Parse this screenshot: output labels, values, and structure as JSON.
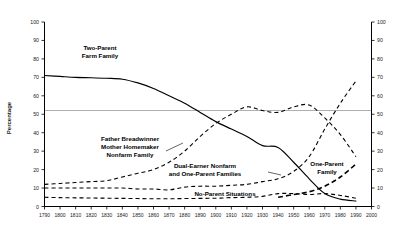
{
  "chart_data": {
    "type": "line",
    "title": "",
    "xlabel": "",
    "ylabel": "Percentage",
    "xlim": [
      1790,
      2000
    ],
    "ylim": [
      0,
      100
    ],
    "grid": false,
    "legend_position": "inline-annotations",
    "reference_lines": [
      {
        "axis": "y",
        "value": 50,
        "color": "#9a9a9a"
      }
    ],
    "x_ticks": [
      1790,
      1800,
      1810,
      1820,
      1830,
      1840,
      1850,
      1860,
      1870,
      1880,
      1890,
      1900,
      1910,
      1920,
      1930,
      1940,
      1950,
      1960,
      1970,
      1980,
      1990,
      2000
    ],
    "y_ticks": [
      0,
      10,
      20,
      30,
      40,
      50,
      60,
      70,
      80,
      90,
      100
    ],
    "y_ticks_right": [
      0,
      10,
      20,
      30,
      40,
      50,
      60,
      70,
      80,
      90,
      100
    ],
    "series": [
      {
        "name": "Two-Parent Farm Family",
        "style": "solid",
        "x": [
          1790,
          1800,
          1810,
          1820,
          1830,
          1840,
          1850,
          1860,
          1870,
          1880,
          1890,
          1900,
          1910,
          1920,
          1930,
          1940,
          1950,
          1960,
          1970,
          1980,
          1990
        ],
        "values": [
          71,
          70.5,
          70,
          69.8,
          69.5,
          69,
          67,
          64,
          60,
          56,
          51,
          46,
          42,
          38,
          33,
          32,
          24,
          15,
          7,
          4,
          3
        ]
      },
      {
        "name": "Father Breadwinner Mother Homemaker Nonfarm Family",
        "style": "dashed",
        "x": [
          1790,
          1800,
          1810,
          1820,
          1830,
          1840,
          1850,
          1860,
          1870,
          1880,
          1890,
          1900,
          1910,
          1920,
          1930,
          1940,
          1950,
          1960,
          1970,
          1980,
          1990
        ],
        "values": [
          12,
          12.5,
          13,
          13.5,
          14,
          16,
          18,
          20,
          24,
          30,
          38,
          45,
          50,
          54,
          52,
          51,
          54,
          55,
          48,
          39,
          27
        ]
      },
      {
        "name": "Dual-Earner Nonfarm and One-Parent Families",
        "style": "dashed",
        "x": [
          1790,
          1800,
          1810,
          1820,
          1830,
          1840,
          1850,
          1860,
          1870,
          1880,
          1890,
          1900,
          1910,
          1920,
          1930,
          1940,
          1950,
          1960,
          1970,
          1980,
          1990
        ],
        "values": [
          10,
          10,
          10,
          10,
          10,
          10,
          9.5,
          9.5,
          9,
          10.5,
          11,
          11,
          11.5,
          12,
          13.5,
          15,
          19,
          27,
          42,
          56,
          68
        ]
      },
      {
        "name": "No-Parent Situations",
        "style": "dashed",
        "x": [
          1790,
          1800,
          1810,
          1820,
          1830,
          1840,
          1850,
          1860,
          1870,
          1880,
          1890,
          1900,
          1910,
          1920,
          1930,
          1940,
          1950,
          1960,
          1970,
          1980,
          1990
        ],
        "values": [
          5,
          4.8,
          4.7,
          4.6,
          4.5,
          4.4,
          4.3,
          4.2,
          4.2,
          4.3,
          4.4,
          4.5,
          4.8,
          5,
          5.5,
          7,
          7,
          6.5,
          7,
          6,
          4.5
        ]
      },
      {
        "name": "One-Parent Family",
        "style": "dashed-thick",
        "x": [
          1940,
          1950,
          1960,
          1970,
          1980,
          1990
        ],
        "values": [
          5,
          6.5,
          8,
          11,
          16,
          23
        ]
      }
    ],
    "annotations": [
      {
        "label": "Two-Parent\nFarm Family",
        "line1": "Two-Parent",
        "line2": "Farm Family",
        "x_px": 100,
        "y_px": 50
      },
      {
        "label": "Father Breadwinner\nMother Homemaker\nNonfarm Family",
        "line1": "Father Breadwinner",
        "line2": "Mother Homemaker",
        "line3": "Nonfarm Family",
        "x_px": 130,
        "y_px": 140
      },
      {
        "label": "Dual-Earner Nonfarm\nand One-Parent Families",
        "line1": "Dual-Earner Nonfarm",
        "line2": "and One-Parent Families",
        "x_px": 205,
        "y_px": 170
      },
      {
        "label": "No-Parent Situations",
        "line1": "No-Parent Situations",
        "x_px": 225,
        "y_px": 196
      },
      {
        "label": "One-Parent\nFamily",
        "line1": "One-Parent",
        "line2": "Family",
        "x_px": 327,
        "y_px": 166
      }
    ]
  },
  "labels": {
    "y_axis_title": "Percentage",
    "two_parent_farm_l1": "Two-Parent",
    "two_parent_farm_l2": "Farm Family",
    "father_bread_l1": "Father Breadwinner",
    "father_bread_l2": "Mother Homemaker",
    "father_bread_l3": "Nonfarm Family",
    "dual_earner_l1": "Dual-Earner Nonfarm",
    "dual_earner_l2": "and One-Parent Families",
    "no_parent_l1": "No-Parent Situations",
    "one_parent_l1": "One-Parent",
    "one_parent_l2": "Family"
  },
  "y_tick_labels": [
    "100",
    "90",
    "80",
    "70",
    "60",
    "50",
    "40",
    "30",
    "20",
    "10",
    "0"
  ],
  "y_tick_labels_right": [
    "100",
    "90",
    "80",
    "70",
    "60",
    "50",
    "40",
    "30",
    "20",
    "10",
    "0"
  ],
  "x_tick_labels": [
    "1790",
    "1800",
    "1810",
    "1820",
    "1830",
    "1840",
    "1850",
    "1860",
    "1870",
    "1880",
    "1890",
    "1900",
    "1910",
    "1920",
    "1930",
    "1940",
    "1950",
    "1960",
    "1970",
    "1980",
    "1990",
    "2000"
  ],
  "colors": {
    "axis": "#000000",
    "reference_line": "#9a9a9a",
    "curve": "#000000",
    "background": "#ffffff"
  }
}
